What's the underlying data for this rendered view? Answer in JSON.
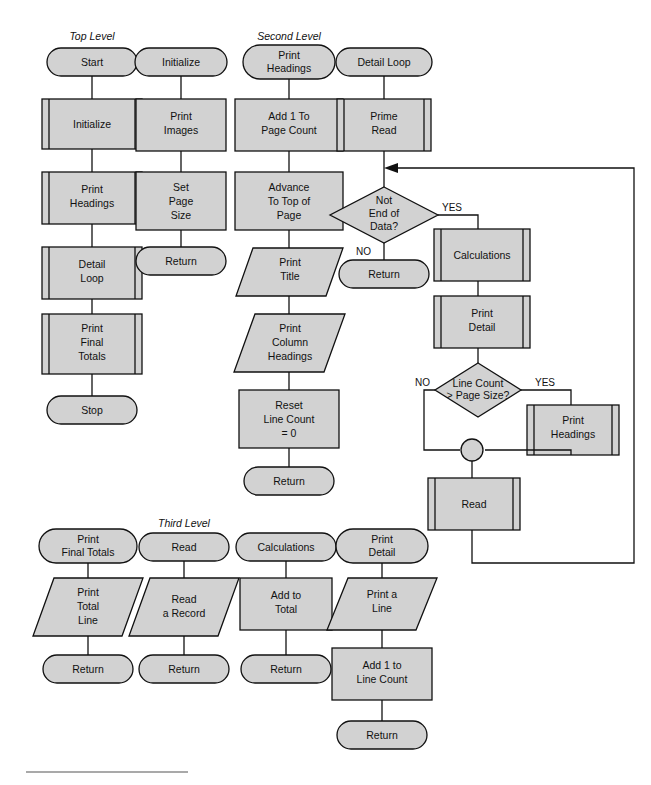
{
  "page": {
    "width": 651,
    "height": 785,
    "background": "#ffffff",
    "shape_fill": "#d2d2d2",
    "stroke": "#111111"
  },
  "section_labels": {
    "top": "Top Level",
    "second": "Second Level",
    "third": "Third Level"
  },
  "columns": {
    "top_level": {
      "name": "Top Level",
      "nodes": [
        {
          "id": "tl-start",
          "type": "terminator",
          "text": "Start"
        },
        {
          "id": "tl-initialize",
          "type": "predefined-process",
          "text": "Initialize"
        },
        {
          "id": "tl-print-head",
          "type": "predefined-process",
          "text": "Print\nHeadings"
        },
        {
          "id": "tl-detail-loop",
          "type": "predefined-process",
          "text": "Detail\nLoop"
        },
        {
          "id": "tl-print-final",
          "type": "predefined-process",
          "text": "Print\nFinal\nTotals"
        },
        {
          "id": "tl-stop",
          "type": "terminator",
          "text": "Stop"
        }
      ]
    },
    "initialize_module": {
      "name": "Initialize",
      "nodes": [
        {
          "id": "in-header",
          "type": "terminator",
          "text": "Initialize"
        },
        {
          "id": "in-print",
          "type": "process",
          "text": "Print\nImages"
        },
        {
          "id": "in-setpage",
          "type": "process",
          "text": "Set\nPage\nSize"
        },
        {
          "id": "in-return",
          "type": "terminator",
          "text": "Return"
        }
      ]
    },
    "print_headings_module": {
      "name": "Print Headings",
      "nodes": [
        {
          "id": "ph-header",
          "type": "terminator",
          "text": "Print\nHeadings"
        },
        {
          "id": "ph-add1",
          "type": "process",
          "text": "Add 1 To\nPage Count"
        },
        {
          "id": "ph-advance",
          "type": "process",
          "text": "Advance\nTo Top of\nPage"
        },
        {
          "id": "ph-title",
          "type": "input-output",
          "text": "Print\nTitle"
        },
        {
          "id": "ph-colhead",
          "type": "input-output",
          "text": "Print\nColumn\nHeadings"
        },
        {
          "id": "ph-reset",
          "type": "process",
          "text": "Reset\nLine Count\n= 0"
        },
        {
          "id": "ph-return",
          "type": "terminator",
          "text": "Return"
        }
      ]
    },
    "detail_loop_module": {
      "name": "Detail Loop",
      "nodes": [
        {
          "id": "dl-header",
          "type": "terminator",
          "text": "Detail Loop"
        },
        {
          "id": "dl-prime-read",
          "type": "predefined-process",
          "text": "Prime\nRead"
        },
        {
          "id": "dl-not-eod",
          "type": "decision",
          "text": "Not\nEnd of\nData?"
        },
        {
          "id": "dl-return",
          "type": "terminator",
          "text": "Return"
        },
        {
          "id": "dl-calc",
          "type": "predefined-process",
          "text": "Calculations"
        },
        {
          "id": "dl-print-det",
          "type": "predefined-process",
          "text": "Print\nDetail"
        },
        {
          "id": "dl-linecount",
          "type": "decision",
          "text": "Line Count\n> Page Size?"
        },
        {
          "id": "dl-print-head",
          "type": "predefined-process",
          "text": "Print\nHeadings"
        },
        {
          "id": "dl-merge",
          "type": "connector",
          "text": ""
        },
        {
          "id": "dl-read",
          "type": "predefined-process",
          "text": "Read"
        }
      ],
      "branch_labels": {
        "not_eod_yes": "YES",
        "not_eod_no": "NO",
        "linecount_no": "NO",
        "linecount_yes": "YES"
      }
    },
    "print_final_totals_module": {
      "name": "Print Final Totals",
      "nodes": [
        {
          "id": "pft-header",
          "type": "terminator",
          "text": "Print\nFinal Totals"
        },
        {
          "id": "pft-line",
          "type": "input-output",
          "text": "Print\nTotal\nLine"
        },
        {
          "id": "pft-return",
          "type": "terminator",
          "text": "Return"
        }
      ]
    },
    "read_module": {
      "name": "Read",
      "nodes": [
        {
          "id": "rd-header",
          "type": "terminator",
          "text": "Read"
        },
        {
          "id": "rd-record",
          "type": "input-output",
          "text": "Read\na Record"
        },
        {
          "id": "rd-return",
          "type": "terminator",
          "text": "Return"
        }
      ]
    },
    "calculations_module": {
      "name": "Calculations",
      "nodes": [
        {
          "id": "cl-header",
          "type": "terminator",
          "text": "Calculations"
        },
        {
          "id": "cl-add",
          "type": "process",
          "text": "Add to\nTotal"
        },
        {
          "id": "cl-return",
          "type": "terminator",
          "text": "Return"
        }
      ]
    },
    "print_detail_module": {
      "name": "Print Detail",
      "nodes": [
        {
          "id": "pd-header",
          "type": "terminator",
          "text": "Print\nDetail"
        },
        {
          "id": "pd-line",
          "type": "input-output",
          "text": "Print a\nLine"
        },
        {
          "id": "pd-add1",
          "type": "process",
          "text": "Add 1 to\nLine Count"
        },
        {
          "id": "pd-return",
          "type": "terminator",
          "text": "Return"
        }
      ]
    }
  },
  "text": {
    "start": "Start",
    "initialize": "Initialize",
    "print_headings": "Print\nHeadings",
    "print_headings_l1": "Print",
    "print_headings_l2": "Headings",
    "detail_loop_l1": "Detail",
    "detail_loop_l2": "Loop",
    "detail_loop_one": "Detail Loop",
    "print_final_l1": "Print",
    "print_final_l2": "Final",
    "print_final_l3": "Totals",
    "stop": "Stop",
    "print_images_l1": "Print",
    "print_images_l2": "Images",
    "set_page_l1": "Set",
    "set_page_l2": "Page",
    "set_page_l3": "Size",
    "return": "Return",
    "add1_page_l1": "Add 1 To",
    "add1_page_l2": "Page Count",
    "advance_l1": "Advance",
    "advance_l2": "To Top of",
    "advance_l3": "Page",
    "print_title_l1": "Print",
    "print_title_l2": "Title",
    "print_col_l1": "Print",
    "print_col_l2": "Column",
    "print_col_l3": "Headings",
    "reset_l1": "Reset",
    "reset_l2": "Line Count",
    "reset_l3": "= 0",
    "prime_read_l1": "Prime",
    "prime_read_l2": "Read",
    "not_eod_l1": "Not",
    "not_eod_l2": "End of",
    "not_eod_l3": "Data?",
    "yes": "YES",
    "no": "NO",
    "calculations": "Calculations",
    "print_detail_l1": "Print",
    "print_detail_l2": "Detail",
    "linecount_l1": "Line Count",
    "linecount_l2": "> Page Size?",
    "read": "Read",
    "print_final_totals_l1": "Print",
    "print_final_totals_l2": "Final Totals",
    "print_total_l1": "Print",
    "print_total_l2": "Total",
    "print_total_l3": "Line",
    "read_record_l1": "Read",
    "read_record_l2": "a Record",
    "add_to_total_l1": "Add to",
    "add_to_total_l2": "Total",
    "print_a_line_l1": "Print a",
    "print_a_line_l2": "Line",
    "add1_line_l1": "Add 1 to",
    "add1_line_l2": "Line Count"
  }
}
